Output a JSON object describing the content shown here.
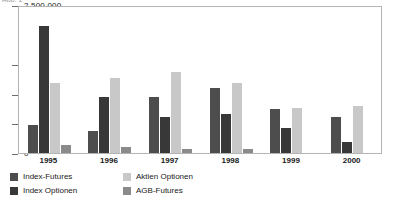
{
  "title_fragment": "Abb. 1",
  "chart_data": {
    "type": "bar",
    "title": "",
    "subtitle": "",
    "xlabel": "",
    "ylabel": "",
    "grid": false,
    "legend_position": "bottom",
    "ylim": [
      0,
      2500000
    ],
    "ytick_labels": [
      "0",
      "500 000",
      "1 000 000",
      "1 500 000",
      "2 500 000"
    ],
    "ytick_values": [
      0,
      500000,
      1000000,
      1500000,
      2500000
    ],
    "categories": [
      "1995",
      "1996",
      "1997",
      "1998",
      "1999",
      "2000"
    ],
    "series": [
      {
        "name": "Index-Futures",
        "color": "#4d4d4d",
        "values": [
          470000,
          375000,
          950000,
          1090000,
          745000,
          600000
        ]
      },
      {
        "name": "Index Optionen",
        "color": "#383838",
        "values": [
          2150000,
          950000,
          600000,
          660000,
          430000,
          190000
        ]
      },
      {
        "name": "Aktien Optionen",
        "color": "#c8c8c8",
        "values": [
          1190000,
          1270000,
          1370000,
          1185000,
          760000,
          790000
        ]
      },
      {
        "name": "AGB-Futures",
        "color": "#8a8a8a",
        "values": [
          130000,
          110000,
          75000,
          60000,
          0,
          0
        ]
      }
    ]
  },
  "legend": {
    "columns": [
      {
        "entries": [
          0,
          1
        ]
      },
      {
        "entries": [
          2,
          3
        ]
      }
    ]
  }
}
